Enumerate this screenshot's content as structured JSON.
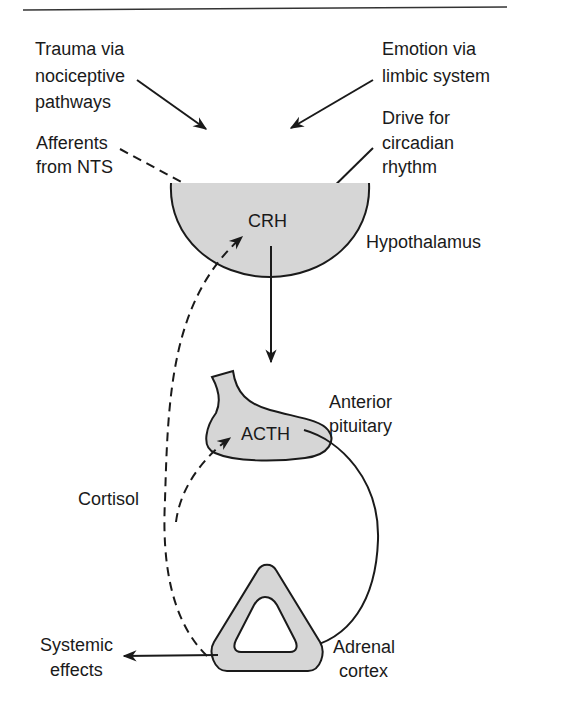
{
  "diagram": {
    "colors": {
      "organ_fill": "#d6d6d6",
      "stroke": "#1a1a1a",
      "background": "#ffffff"
    },
    "inputs": {
      "trauma": [
        "Trauma via",
        "nociceptive",
        "pathways"
      ],
      "emotion": [
        "Emotion via",
        "limbic system"
      ],
      "afferents": [
        "Afferents",
        "from NTS"
      ],
      "circadian": [
        "Drive for",
        "circadian",
        "rhythm"
      ]
    },
    "hypothalamus": {
      "hormone": "CRH",
      "label": "Hypothalamus"
    },
    "pituitary": {
      "hormone": "ACTH",
      "label": [
        "Anterior",
        "pituitary"
      ]
    },
    "adrenal": {
      "label": [
        "Adrenal",
        "cortex"
      ]
    },
    "feedback": {
      "label": "Cortisol",
      "style": "dashed"
    },
    "output": {
      "label": [
        "Systemic",
        "effects"
      ]
    }
  }
}
